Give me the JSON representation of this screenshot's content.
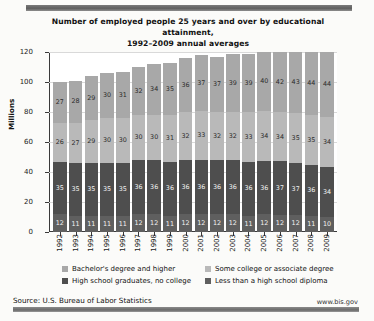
{
  "chart_data": {
    "type": "bar",
    "stacked": true,
    "title": "Number of employed people 25 years and over by educational attainment, 1992–2009 annual averages",
    "title_line1": "Number of employed people 25 years and over by educational attainment,",
    "title_line2": "1992–2009 annual averages",
    "xlabel": "",
    "ylabel": "Millions",
    "ylim": [
      0,
      120
    ],
    "yticks": [
      0,
      20,
      40,
      60,
      80,
      100,
      120
    ],
    "grid": true,
    "legend_position": "bottom",
    "categories": [
      "1992",
      "1993",
      "1994",
      "1995",
      "1996",
      "1997",
      "1998",
      "1999",
      "2000",
      "2001",
      "2002",
      "2003",
      "2004",
      "2005",
      "2006",
      "2007",
      "2008",
      "2009"
    ],
    "series": [
      {
        "name": "Bachelor's degree and higher",
        "color": "#a8a8a8",
        "values": [
          27,
          28,
          29,
          30,
          31,
          32,
          34,
          35,
          36,
          37,
          37,
          39,
          39,
          40,
          42,
          43,
          44,
          44
        ]
      },
      {
        "name": "Some college or associate degree",
        "color": "#b9b9b9",
        "values": [
          26,
          27,
          29,
          30,
          30,
          30,
          30,
          31,
          32,
          33,
          32,
          32,
          33,
          34,
          34,
          35,
          35,
          34
        ]
      },
      {
        "name": "High school graduates, no college",
        "color": "#4e4e4e",
        "values": [
          35,
          35,
          35,
          35,
          35,
          36,
          36,
          36,
          36,
          36,
          36,
          36,
          36,
          36,
          37,
          37,
          36,
          34
        ]
      },
      {
        "name": "Less than a high school diploma",
        "color": "#5f5f5f",
        "values": [
          12,
          11,
          11,
          11,
          11,
          12,
          12,
          11,
          12,
          12,
          12,
          12,
          11,
          12,
          12,
          12,
          11,
          10
        ]
      }
    ]
  },
  "legend": {
    "items": [
      {
        "label": "Bachelor's degree and higher",
        "swatch": "sw0"
      },
      {
        "label": "Some college or associate degree",
        "swatch": "sw1"
      },
      {
        "label": "High school graduates, no college",
        "swatch": "sw2"
      },
      {
        "label": "Less than a high school diploma",
        "swatch": "sw3"
      }
    ]
  },
  "footer": {
    "source": "Source: U.S. Bureau of Labor Statistics",
    "website": "www.bis.gov"
  }
}
